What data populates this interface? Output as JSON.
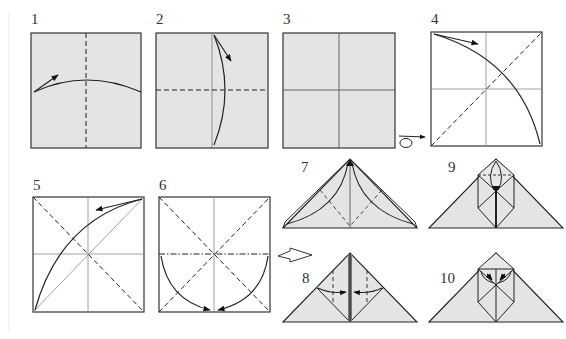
{
  "figure": {
    "type": "origami-instructions",
    "paper_color": "#e4e4e4",
    "line_color": "#222222",
    "crease_color": "#888888",
    "steps": [
      {
        "number": "1",
        "label_pos": [
          31,
          14
        ],
        "description": "Valley fold in half, then unfold"
      },
      {
        "number": "2",
        "label_pos": [
          156,
          14
        ],
        "description": "Valley fold in half the other way, then unfold"
      },
      {
        "number": "3",
        "label_pos": [
          283,
          14
        ],
        "description": "Creased square, turn over"
      },
      {
        "number": "4",
        "label_pos": [
          431,
          14
        ],
        "description": "Valley fold diagonally, then unfold"
      },
      {
        "number": "5",
        "label_pos": [
          33,
          179
        ],
        "description": "Valley fold along the other diagonal, then unfold"
      },
      {
        "number": "6",
        "label_pos": [
          159,
          179
        ],
        "description": "Collapse into a waterbomb base"
      },
      {
        "number": "7",
        "label_pos": [
          302,
          163
        ],
        "description": "Fold flaps up to the top point"
      },
      {
        "number": "8",
        "label_pos": [
          303,
          272
        ],
        "description": "Valley fold edges to the center line"
      },
      {
        "number": "9",
        "label_pos": [
          448,
          163
        ],
        "description": "Fold the top triangle down"
      },
      {
        "number": "10",
        "label_pos": [
          440,
          272
        ],
        "description": "Fold the flaps outward"
      }
    ],
    "symbols": {
      "turn_over": "turn-over-icon",
      "next_row": "outline-arrow-icon"
    }
  }
}
